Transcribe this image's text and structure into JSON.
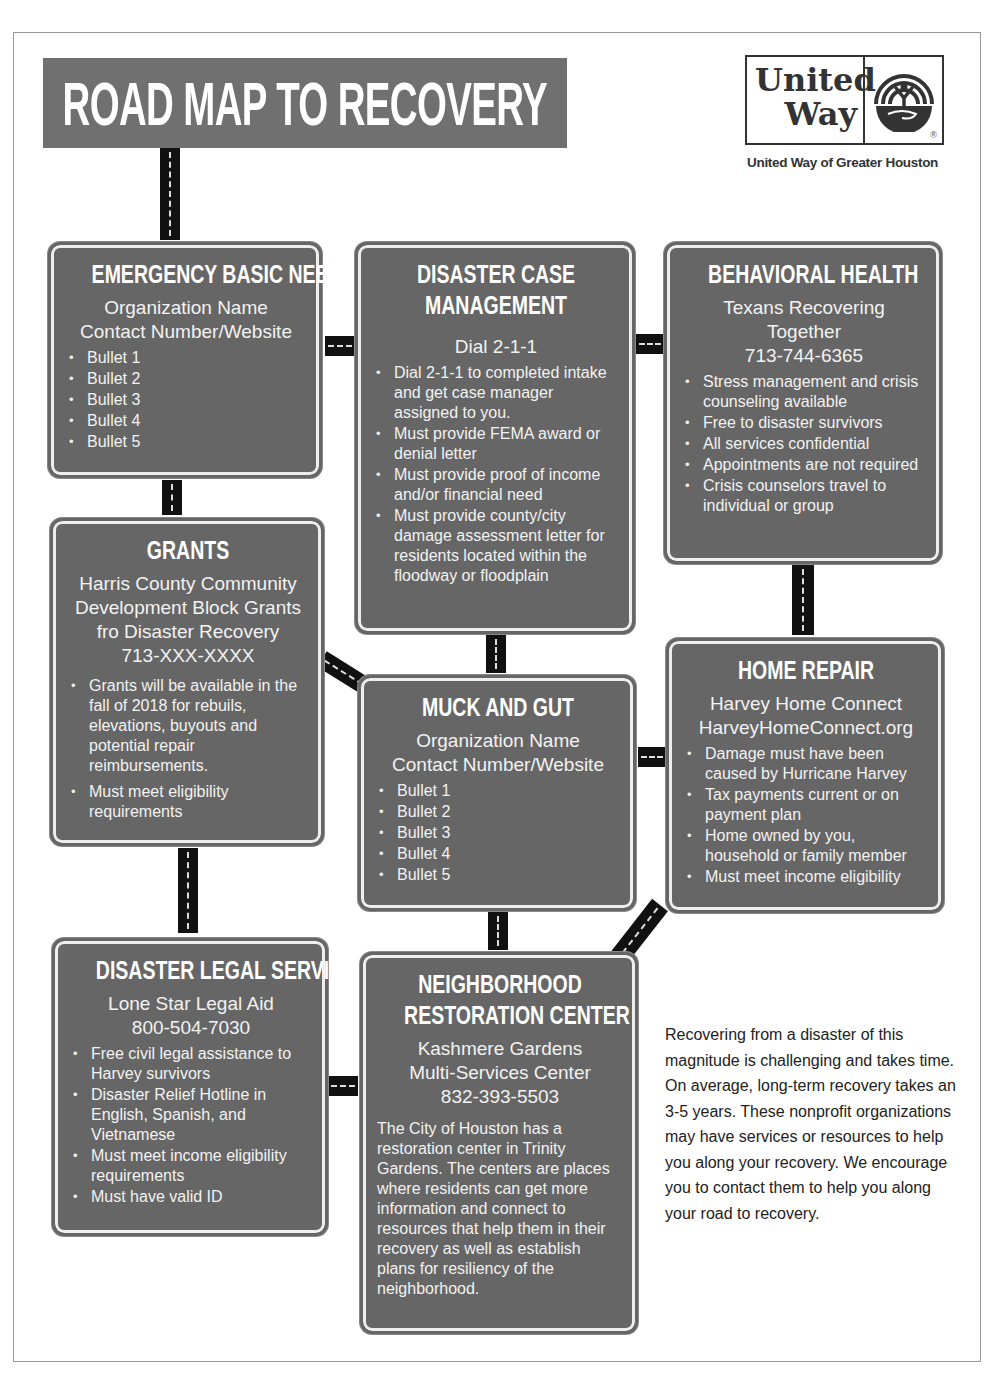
{
  "header": {
    "title": "ROAD MAP TO RECOVERY",
    "logo": {
      "line1": "United",
      "line2": "Way",
      "registered_mark": "®",
      "caption": "United Way of Greater Houston",
      "icon": "united-way-hand-emblem-icon"
    }
  },
  "signs": {
    "emergency": {
      "title": "EMERGENCY BASIC NEEDS",
      "org_lines": [
        "Organization Name",
        "Contact Number/Website"
      ],
      "bullets": [
        "Bullet 1",
        "Bullet 2",
        "Bullet 3",
        "Bullet 4",
        "Bullet 5"
      ]
    },
    "case_management": {
      "title_lines": [
        "DISASTER CASE",
        "MANAGEMENT"
      ],
      "org_lines": [
        "Dial 2-1-1"
      ],
      "bullets": [
        "Dial 2-1-1 to completed intake and get case manager assigned to you.",
        "Must provide FEMA award or denial letter",
        "Must provide proof of income and/or financial need",
        "Must provide county/city damage assessment letter for residents located within the floodway or floodplain"
      ]
    },
    "behavioral": {
      "title": "BEHAVIORAL HEALTH",
      "org_lines": [
        "Texans Recovering",
        "Together",
        "713-744-6365"
      ],
      "bullets": [
        "Stress management and crisis counseling available",
        "Free to disaster survivors",
        "All services confidential",
        "Appointments are not required",
        "Crisis counselors travel to individual or group"
      ]
    },
    "grants": {
      "title": "GRANTS",
      "org_lines": [
        "Harris County Community",
        "Development Block Grants",
        "fro Disaster Recovery",
        "713-XXX-XXXX"
      ],
      "bullets": [
        "Grants will be available in the fall of 2018 for rebuils, elevations, buyouts and potential repair reimbursements.",
        "Must meet eligibility requirements"
      ]
    },
    "muck": {
      "title": "MUCK AND GUT",
      "org_lines": [
        "Organization Name",
        "Contact Number/Website"
      ],
      "bullets": [
        "Bullet 1",
        "Bullet 2",
        "Bullet 3",
        "Bullet 4",
        "Bullet 5"
      ]
    },
    "home_repair": {
      "title": "HOME REPAIR",
      "org_lines": [
        "Harvey Home Connect",
        "HarveyHomeConnect.org"
      ],
      "bullets": [
        "Damage must have been caused by Hurricane Harvey",
        "Tax payments current or on payment plan",
        "Home owned by you, household or family member",
        "Must meet income eligibility"
      ]
    },
    "legal": {
      "title": "DISASTER LEGAL SERVICES",
      "org_lines": [
        "Lone Star Legal Aid",
        "800-504-7030"
      ],
      "bullets": [
        "Free civil legal assistance to Harvey survivors",
        "Disaster Relief Hotline in English, Spanish, and Vietnamese",
        "Must meet income eligibility requirements",
        "Must have valid ID"
      ]
    },
    "restoration": {
      "title_lines": [
        "NEIGHBORHOOD",
        "RESTORATION CENTER"
      ],
      "org_lines": [
        "Kashmere Gardens",
        "Multi-Services Center",
        "832-393-5503"
      ],
      "body": "The City of Houston has a restoration center in Trinity Gardens. The centers are places where residents can get more information and connect to resources that help them in their recovery as well as establish plans for resiliency of the neighborhood."
    }
  },
  "intro": {
    "text": "Recovering from a disaster of this magnitude is challenging and takes time. On average, long-term recovery takes an 3-5 years. These nonprofit organizations may have services or resources to help you along your recovery. We encourage you to contact them to help you along your road to recovery."
  },
  "colors": {
    "sign_fill": "#666666",
    "banner_fill": "#707070",
    "road": "#111111",
    "sign_text": "#f2f2f2"
  }
}
